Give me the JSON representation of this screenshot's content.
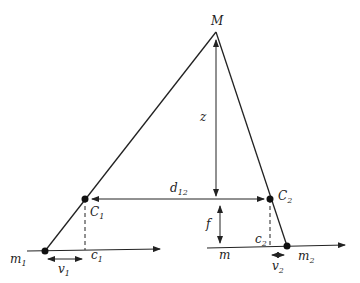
{
  "diagram": {
    "title": "",
    "labels": {
      "M": "M",
      "z": "z",
      "d12_main": "d",
      "d12_sub": "12",
      "C1_main": "C",
      "C1_sub": "1",
      "C2_main": "C",
      "C2_sub": "2",
      "f": "f",
      "m1_main": "m",
      "m1_sub": "1",
      "m2_main": "m",
      "m2_sub": "2",
      "c1_main": "c",
      "c1_sub": "1",
      "c2_main": "c",
      "c2_sub": "2",
      "m": "m",
      "v1_main": "v",
      "v1_sub": "1",
      "v2_main": "v",
      "v2_sub": "2"
    },
    "points": {
      "M": [
        216,
        32
      ],
      "C1": [
        85,
        199
      ],
      "C2": [
        270,
        199
      ],
      "m1": [
        45,
        251
      ],
      "m2": [
        287,
        246
      ]
    },
    "colors": {
      "stroke": "#222222",
      "background": "#ffffff"
    }
  }
}
